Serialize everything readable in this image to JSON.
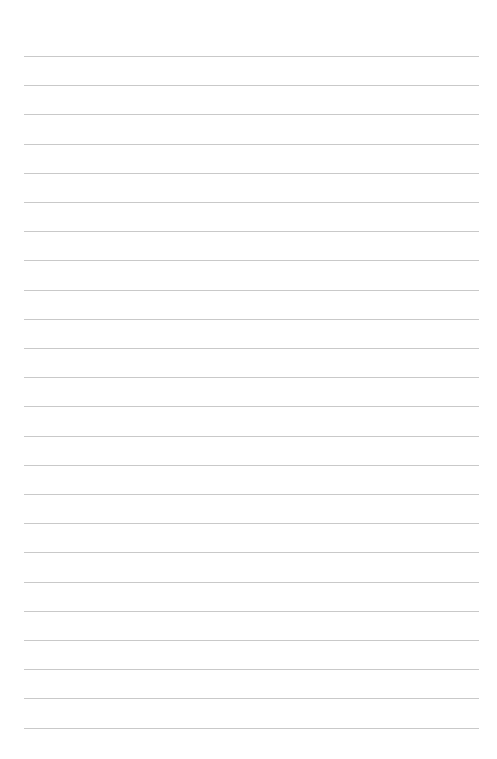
{
  "page": {
    "type": "lined-paper",
    "background_color": "#ffffff",
    "rule_color": "#c9c9c9",
    "rule_count": 24,
    "first_rule_y": 56,
    "rule_spacing": 29.2,
    "rule_left": 24,
    "rule_right": 479
  }
}
